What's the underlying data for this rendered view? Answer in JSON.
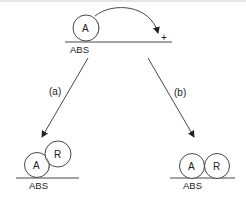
{
  "diagram": {
    "top": {
      "surface_label": "ABS",
      "adsorbate_label": "A",
      "site_symbol": "+"
    },
    "paths": [
      {
        "id": "a",
        "label": "(a)"
      },
      {
        "id": "b",
        "label": "(b)"
      }
    ],
    "bottom_left": {
      "surface_label": "ABS",
      "adsorbate_label": "A",
      "reactant_label": "R"
    },
    "bottom_right": {
      "surface_label": "ABS",
      "adsorbate_label": "A",
      "reactant_label": "R"
    },
    "colors": {
      "line": "#333333",
      "hatch": "#555555",
      "background": "#ffffff"
    }
  }
}
